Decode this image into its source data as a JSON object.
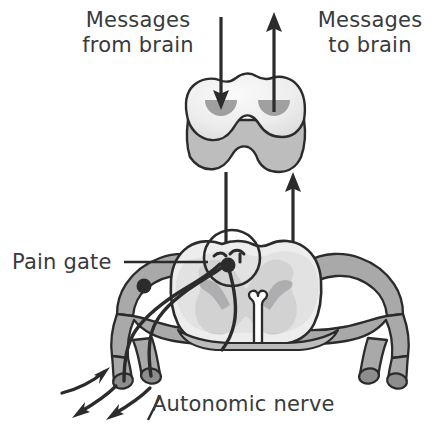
{
  "figure": {
    "width": 444,
    "height": 443,
    "background": "#ffffff"
  },
  "labels": {
    "messages_from_brain": "Messages\nfrom brain",
    "messages_to_brain": "Messages\nto brain",
    "pain_gate": "Pain gate",
    "autonomic_nerve": "Autonomic nerve"
  },
  "colors": {
    "text": "#3a3a3c",
    "outline": "#2b2b2b",
    "white_matter": "#ededee",
    "white_matter_light": "#f4f4f5",
    "gray_matter": "#c9c9ca",
    "gray_matter_dark": "#a8a8a9",
    "nerve_fill": "#a9a9aa",
    "nerve_cap": "#8d8d8e",
    "cord_front_face": "#bdbdbe",
    "depression": "#a0a0a1",
    "arrow": "#2b2b2b",
    "background": "#ffffff"
  },
  "anatomy": {
    "upper_segment": {
      "name": "spinal-cord-segment-block",
      "description": "Three-dimensional block of spinal cord with wavy top face and two dark depressions"
    },
    "lower_segment": {
      "name": "spinal-cord-cross-section",
      "description": "Transverse section showing butterfly-shaped gray matter, central canal and nerve roots"
    },
    "pain_gate_marker": {
      "name": "pain-gate-circle",
      "cx": 232,
      "cy": 258,
      "r": 28
    },
    "dorsal_root_ganglion": {
      "cx": 144,
      "cy": 286,
      "r": 7
    },
    "synapse_node": {
      "cx": 228,
      "cy": 265,
      "r": 7
    }
  },
  "arrows": {
    "descending": {
      "name": "messages-from-brain-arrow",
      "direction": "down",
      "meaning": "Messages from brain"
    },
    "ascending": {
      "name": "messages-to-brain-arrow",
      "direction": "up",
      "meaning": "Messages to brain"
    },
    "afferent_input": {
      "name": "sensory-input-arrow",
      "direction": "up-right"
    },
    "efferent_output_1": {
      "name": "nerve-output-arrow-1",
      "direction": "down-left"
    },
    "efferent_output_2": {
      "name": "nerve-output-arrow-2",
      "direction": "down-left"
    }
  }
}
